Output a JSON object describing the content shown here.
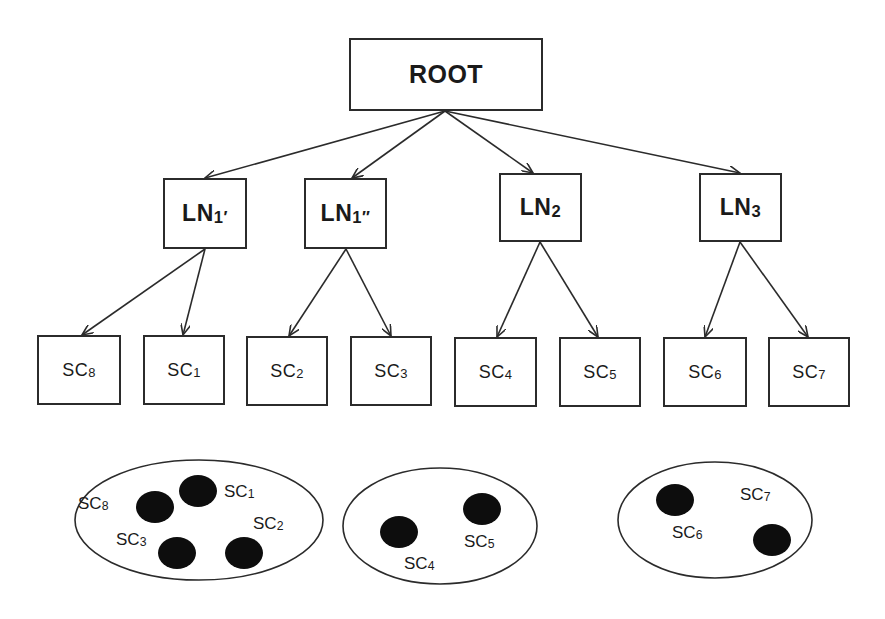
{
  "diagram": {
    "type": "tree-hierarchy",
    "root": {
      "id": "ROOT",
      "label": "ROOT",
      "box": [
        349,
        38,
        194,
        73
      ]
    },
    "level1": [
      {
        "id": "LN1p",
        "base": "LN",
        "sub": "1′",
        "box": [
          163,
          178,
          84,
          71
        ]
      },
      {
        "id": "LN1pp",
        "base": "LN",
        "sub": "1″",
        "box": [
          304,
          178,
          83,
          71
        ]
      },
      {
        "id": "LN2",
        "base": "LN",
        "sub": "2",
        "box": [
          499,
          173,
          83,
          69
        ]
      },
      {
        "id": "LN3",
        "base": "LN",
        "sub": "3",
        "box": [
          699,
          173,
          83,
          69
        ]
      }
    ],
    "leaves": [
      {
        "id": "SC8",
        "base": "SC",
        "sub": "8",
        "parent": "LN1p",
        "box": [
          37,
          335,
          84,
          70
        ]
      },
      {
        "id": "SC1",
        "base": "SC",
        "sub": "1",
        "parent": "LN1p",
        "box": [
          143,
          335,
          82,
          70
        ]
      },
      {
        "id": "SC2",
        "base": "SC",
        "sub": "2",
        "parent": "LN1pp",
        "box": [
          246,
          336,
          82,
          70
        ]
      },
      {
        "id": "SC3",
        "base": "SC",
        "sub": "3",
        "parent": "LN1pp",
        "box": [
          350,
          336,
          82,
          70
        ]
      },
      {
        "id": "SC4",
        "base": "SC",
        "sub": "4",
        "parent": "LN2",
        "box": [
          454,
          337,
          83,
          70
        ]
      },
      {
        "id": "SC5",
        "base": "SC",
        "sub": "5",
        "parent": "LN2",
        "box": [
          559,
          337,
          82,
          70
        ]
      },
      {
        "id": "SC6",
        "base": "SC",
        "sub": "6",
        "parent": "LN3",
        "box": [
          663,
          337,
          84,
          70
        ]
      },
      {
        "id": "SC7",
        "base": "SC",
        "sub": "7",
        "parent": "LN3",
        "box": [
          768,
          337,
          82,
          70
        ]
      }
    ],
    "edges": [
      {
        "from": "ROOT",
        "to": "LN1p",
        "x1": 445,
        "y1": 111,
        "x2": 205,
        "y2": 178
      },
      {
        "from": "ROOT",
        "to": "LN1pp",
        "x1": 445,
        "y1": 111,
        "x2": 352,
        "y2": 178
      },
      {
        "from": "ROOT",
        "to": "LN2",
        "x1": 445,
        "y1": 111,
        "x2": 533,
        "y2": 173
      },
      {
        "from": "ROOT",
        "to": "LN3",
        "x1": 445,
        "y1": 111,
        "x2": 740,
        "y2": 173
      },
      {
        "from": "LN1p",
        "to": "SC8",
        "x1": 205,
        "y1": 249,
        "x2": 82,
        "y2": 335
      },
      {
        "from": "LN1p",
        "to": "SC1",
        "x1": 205,
        "y1": 249,
        "x2": 183,
        "y2": 335
      },
      {
        "from": "LN1pp",
        "to": "SC2",
        "x1": 346,
        "y1": 249,
        "x2": 289,
        "y2": 336
      },
      {
        "from": "LN1pp",
        "to": "SC3",
        "x1": 346,
        "y1": 249,
        "x2": 391,
        "y2": 336
      },
      {
        "from": "LN2",
        "to": "SC4",
        "x1": 540,
        "y1": 242,
        "x2": 497,
        "y2": 337
      },
      {
        "from": "LN2",
        "to": "SC5",
        "x1": 540,
        "y1": 242,
        "x2": 598,
        "y2": 337
      },
      {
        "from": "LN3",
        "to": "SC6",
        "x1": 740,
        "y1": 242,
        "x2": 705,
        "y2": 337
      },
      {
        "from": "LN3",
        "to": "SC7",
        "x1": 740,
        "y1": 242,
        "x2": 808,
        "y2": 337
      }
    ],
    "clusters": [
      {
        "id": "cluster-1",
        "cx": 199,
        "cy": 520,
        "rx": 124,
        "ry": 60,
        "members": [
          {
            "base": "SC",
            "sub": "8",
            "dot": [
              155,
              507
            ],
            "label_pos": [
              78,
              494
            ]
          },
          {
            "base": "SC",
            "sub": "1",
            "dot": [
              198,
              491
            ],
            "label_pos": [
              224,
              482
            ]
          },
          {
            "base": "SC",
            "sub": "2",
            "dot": [
              244,
              553
            ],
            "label_pos": [
              253,
              514
            ]
          },
          {
            "base": "SC",
            "sub": "3",
            "dot": [
              177,
              553
            ],
            "label_pos": [
              116,
              530
            ]
          }
        ]
      },
      {
        "id": "cluster-2",
        "cx": 440,
        "cy": 526,
        "rx": 97,
        "ry": 58,
        "members": [
          {
            "base": "SC",
            "sub": "4",
            "dot": [
              399,
              532
            ],
            "label_pos": [
              404,
              554
            ]
          },
          {
            "base": "SC",
            "sub": "5",
            "dot": [
              482,
              509
            ],
            "label_pos": [
              464,
              532
            ]
          }
        ]
      },
      {
        "id": "cluster-3",
        "cx": 715,
        "cy": 520,
        "rx": 97,
        "ry": 58,
        "members": [
          {
            "base": "SC",
            "sub": "6",
            "dot": [
              675,
              500
            ],
            "label_pos": [
              672,
              523
            ]
          },
          {
            "base": "SC",
            "sub": "7",
            "dot": [
              772,
              540
            ],
            "label_pos": [
              740,
              485
            ]
          }
        ]
      }
    ],
    "colors": {
      "stroke": "#2b2b2b",
      "fill": "#ffffff",
      "dot": "#0d0d0d",
      "text": "#1a1a1a"
    }
  }
}
